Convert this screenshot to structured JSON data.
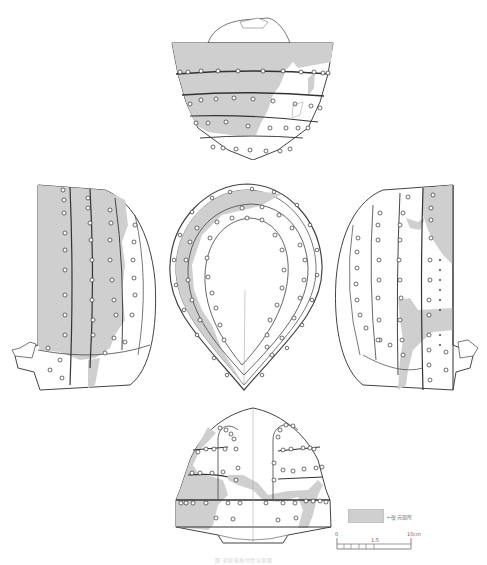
{
  "figure": {
    "type": "archaeological line drawing",
    "views": [
      {
        "id": "top-view",
        "position": "top-center"
      },
      {
        "id": "left-side-view",
        "position": "middle-left"
      },
      {
        "id": "plan-view",
        "position": "middle-center"
      },
      {
        "id": "right-side-view",
        "position": "middle-right"
      },
      {
        "id": "back-view",
        "position": "bottom-center"
      }
    ],
    "colors": {
      "restored_fill": "#cfcfcf",
      "line": "#444444",
      "rivet": "#333333",
      "background": "#ffffff"
    }
  },
  "legend": {
    "label": "←復元箇所"
  },
  "scale_bar": {
    "start_label": "0",
    "ratio_label": "1:5",
    "end_label": "10cm"
  },
  "caption": {
    "text": "図 鋲留衝角付冑実測図"
  }
}
